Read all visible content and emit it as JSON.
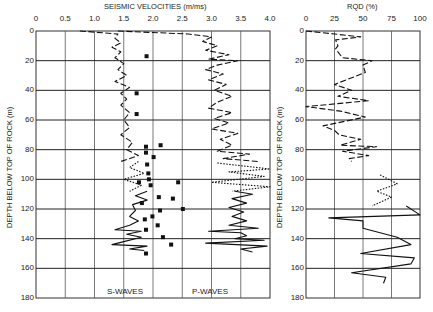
{
  "chart_data": [
    {
      "type": "line",
      "title": "SEISMIC VELOCITIES (m/ms)",
      "xlabel": "SEISMIC VELOCITIES (m/ms)",
      "ylabel": "DEPTH BELOW TOP OF ROCK (m)",
      "xlim": [
        0,
        4.0
      ],
      "ylim": [
        180,
        0
      ],
      "x_ticks": [
        "0",
        "0.5",
        "1.0",
        "1.5",
        "2.0",
        "2.5",
        "3.0",
        "3.5",
        "4.0"
      ],
      "y_ticks": [
        "0",
        "20",
        "40",
        "60",
        "80",
        "100",
        "120",
        "140",
        "160",
        "180"
      ],
      "grid": true,
      "annotations": [
        "S-WAVES",
        "P-WAVES"
      ],
      "series": [
        {
          "name": "S-waves (log, dashed)",
          "style": "dashed",
          "points": [
            [
              0.75,
              0
            ],
            [
              1.4,
              2
            ],
            [
              1.35,
              5
            ],
            [
              1.45,
              8
            ],
            [
              1.3,
              11
            ],
            [
              1.45,
              14
            ],
            [
              1.35,
              18
            ],
            [
              1.5,
              22
            ],
            [
              1.4,
              26
            ],
            [
              1.55,
              30
            ],
            [
              1.35,
              34
            ],
            [
              1.6,
              38
            ],
            [
              1.45,
              42
            ],
            [
              1.55,
              46
            ],
            [
              1.45,
              50
            ],
            [
              1.6,
              55
            ],
            [
              1.5,
              60
            ],
            [
              1.6,
              65
            ],
            [
              1.45,
              70
            ],
            [
              1.65,
              75
            ],
            [
              1.55,
              80
            ],
            [
              1.75,
              84
            ],
            [
              1.45,
              88
            ]
          ]
        },
        {
          "name": "S-waves (log, dotted)",
          "style": "dotted",
          "points": [
            [
              1.75,
              88
            ],
            [
              1.6,
              92
            ],
            [
              1.85,
              96
            ],
            [
              1.5,
              100
            ],
            [
              1.8,
              104
            ],
            [
              1.6,
              108
            ]
          ]
        },
        {
          "name": "S-waves (log, solid)",
          "style": "solid",
          "points": [
            [
              1.9,
              108
            ],
            [
              1.7,
              111
            ],
            [
              1.9,
              114
            ],
            [
              1.65,
              117
            ],
            [
              1.7,
              121
            ],
            [
              1.6,
              125
            ],
            [
              1.75,
              128
            ],
            [
              1.6,
              131
            ],
            [
              1.35,
              134
            ],
            [
              1.8,
              135
            ],
            [
              1.55,
              137
            ],
            [
              1.8,
              139
            ],
            [
              1.5,
              142
            ],
            [
              1.3,
              144
            ],
            [
              1.9,
              145
            ],
            [
              1.6,
              147
            ],
            [
              1.85,
              148
            ]
          ]
        },
        {
          "name": "S-waves (crosshole)",
          "style": "markers",
          "points": [
            [
              1.89,
              17
            ],
            [
              1.72,
              42
            ],
            [
              1.72,
              56
            ],
            [
              2.13,
              77
            ],
            [
              1.88,
              78
            ],
            [
              1.88,
              82
            ],
            [
              2.01,
              85
            ],
            [
              1.9,
              90
            ],
            [
              1.92,
              96
            ],
            [
              1.93,
              100
            ],
            [
              2.43,
              102
            ],
            [
              1.76,
              102
            ],
            [
              1.96,
              104
            ],
            [
              2.1,
              112
            ],
            [
              2.34,
              113
            ],
            [
              1.81,
              116
            ],
            [
              2.51,
              120
            ],
            [
              2.12,
              121
            ],
            [
              1.99,
              125
            ],
            [
              1.86,
              127
            ],
            [
              2.08,
              131
            ],
            [
              1.88,
              134
            ],
            [
              2.17,
              139
            ],
            [
              2.31,
              144
            ],
            [
              1.88,
              150
            ]
          ]
        },
        {
          "name": "P-waves (log, dashed)",
          "style": "dashed",
          "points": [
            [
              1.4,
              0
            ],
            [
              2.6,
              2
            ],
            [
              3.0,
              4
            ],
            [
              2.85,
              7
            ],
            [
              3.1,
              10
            ],
            [
              2.9,
              13
            ],
            [
              3.3,
              16
            ],
            [
              2.95,
              19
            ],
            [
              3.45,
              20
            ],
            [
              3.1,
              23
            ],
            [
              2.9,
              26
            ],
            [
              3.2,
              29
            ],
            [
              2.95,
              33
            ],
            [
              3.25,
              36
            ],
            [
              3.05,
              40
            ],
            [
              3.35,
              44
            ],
            [
              3.1,
              48
            ],
            [
              2.95,
              52
            ],
            [
              3.35,
              55
            ],
            [
              3.05,
              59
            ],
            [
              3.3,
              62
            ],
            [
              3.0,
              66
            ],
            [
              3.45,
              69
            ],
            [
              3.15,
              73
            ],
            [
              3.35,
              77
            ],
            [
              3.1,
              81
            ],
            [
              3.65,
              83
            ],
            [
              3.2,
              86
            ],
            [
              3.8,
              88
            ]
          ]
        },
        {
          "name": "P-waves (log, dotted)",
          "style": "dotted",
          "points": [
            [
              3.1,
              89
            ],
            [
              4.0,
              93
            ],
            [
              3.3,
              95
            ],
            [
              3.9,
              98
            ],
            [
              3.0,
              102
            ],
            [
              4.0,
              105
            ],
            [
              3.35,
              108
            ]
          ]
        },
        {
          "name": "P-waves (log, solid)",
          "style": "solid",
          "points": [
            [
              3.4,
              108
            ],
            [
              3.7,
              110
            ],
            [
              3.35,
              113
            ],
            [
              3.6,
              116
            ],
            [
              3.3,
              119
            ],
            [
              3.55,
              122
            ],
            [
              3.35,
              125
            ],
            [
              3.6,
              128
            ],
            [
              3.3,
              131
            ],
            [
              3.8,
              133
            ],
            [
              2.95,
              135
            ],
            [
              3.5,
              136
            ],
            [
              3.6,
              138
            ],
            [
              3.4,
              140
            ],
            [
              3.9,
              141
            ],
            [
              2.9,
              143
            ],
            [
              3.95,
              145
            ],
            [
              3.5,
              147
            ],
            [
              3.7,
              149
            ]
          ]
        }
      ]
    },
    {
      "type": "line",
      "title": "RQD (%)",
      "xlabel": "RQD (%)",
      "ylabel": "DEPTH BELOW TOP OF ROCK (m)",
      "xlim": [
        0,
        100
      ],
      "ylim": [
        180,
        0
      ],
      "x_ticks": [
        "0",
        "25",
        "50",
        "75",
        "100"
      ],
      "y_ticks": [
        "0",
        "20",
        "40",
        "60",
        "80",
        "100",
        "120",
        "140",
        "160",
        "180"
      ],
      "grid": true,
      "series": [
        {
          "name": "RQD (dashed)",
          "style": "dashed",
          "points": [
            [
              0,
              0
            ],
            [
              25,
              2
            ],
            [
              48,
              4
            ],
            [
              26,
              6
            ],
            [
              28,
              10
            ],
            [
              26,
              12
            ],
            [
              28,
              14
            ],
            [
              32,
              18
            ],
            [
              58,
              20
            ],
            [
              50,
              23
            ],
            [
              52,
              28
            ],
            [
              25,
              36
            ],
            [
              40,
              40
            ],
            [
              28,
              44
            ],
            [
              55,
              47
            ],
            [
              0,
              51
            ],
            [
              30,
              54
            ],
            [
              52,
              58
            ],
            [
              15,
              64
            ],
            [
              25,
              67
            ],
            [
              29,
              70
            ],
            [
              48,
              73
            ],
            [
              30,
              77
            ],
            [
              62,
              78
            ],
            [
              32,
              81
            ],
            [
              55,
              84
            ],
            [
              38,
              86
            ],
            [
              40,
              88
            ]
          ]
        },
        {
          "name": "RQD (dotted)",
          "style": "dotted",
          "points": [
            [
              65,
              97
            ],
            [
              80,
              103
            ],
            [
              62,
              108
            ],
            [
              75,
              112
            ],
            [
              58,
              118
            ]
          ]
        },
        {
          "name": "RQD (solid)",
          "style": "solid",
          "points": [
            [
              88,
              118
            ],
            [
              100,
              124
            ],
            [
              20,
              126
            ],
            [
              50,
              128
            ],
            [
              50,
              133
            ],
            [
              80,
              139
            ],
            [
              92,
              144
            ],
            [
              48,
              150
            ],
            [
              95,
              153
            ],
            [
              92,
              157
            ],
            [
              40,
              163
            ],
            [
              70,
              166
            ],
            [
              68,
              170
            ]
          ]
        }
      ]
    }
  ],
  "labels": {
    "seismic_title": "SEISMIC VELOCITIES (m/ms)",
    "rqd_title": "RQD (%)",
    "y_axis_label": "DEPTH BELOW TOP OF ROCK (m)",
    "s_waves": "S-WAVES",
    "p_waves": "P-WAVES"
  }
}
